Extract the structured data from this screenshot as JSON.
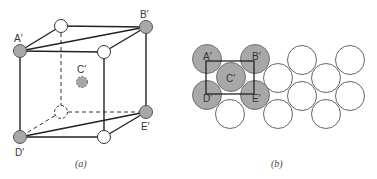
{
  "figure": {
    "panel_a": {
      "caption": "(a)",
      "description": "Unit cell cube with shaded atoms A', B', D', E' at corners and C' at body center; diagonal plane highlighted",
      "labels": {
        "A": "A′",
        "B": "B′",
        "C": "C′",
        "D": "D′",
        "E": "E′"
      }
    },
    "panel_b": {
      "caption": "(b)",
      "description": "Close-packed plane of atoms with shaded atoms A', B', C', D', E' and rectangle outlining the unit cell section",
      "labels": {
        "A": "A′",
        "B": "B′",
        "C": "C′",
        "D": "D′",
        "E": "E′"
      }
    },
    "colors": {
      "shaded_atom": "#a8a8a8",
      "open_atom": "#ffffff",
      "line": "#222222"
    }
  }
}
